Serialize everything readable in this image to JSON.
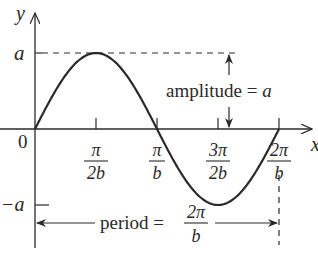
{
  "diagram": {
    "function": "y = a sin(bx)",
    "axes": {
      "x_label": "x",
      "y_label": "y",
      "origin_label": "0"
    },
    "y_ticks": [
      {
        "name": "a",
        "label": "a",
        "value": 1
      },
      {
        "name": "neg-a",
        "label": "−a",
        "value": -1
      }
    ],
    "x_ticks": [
      {
        "name": "pi-over-2b",
        "num": "π",
        "den": "2b",
        "value": 0.25
      },
      {
        "name": "pi-over-b",
        "num": "π",
        "den": "b",
        "value": 0.5
      },
      {
        "name": "3pi-over-2b",
        "num": "3π",
        "den": "2b",
        "value": 0.75
      },
      {
        "name": "2pi-over-b",
        "num": "2π",
        "den": "b",
        "value": 1.0
      }
    ],
    "amplitude": {
      "label": "amplitude = ",
      "var": "a"
    },
    "period": {
      "label": "period = ",
      "num": "2π",
      "den": "b"
    },
    "colors": {
      "ink": "#2a2a2a",
      "background": "#ffffff"
    }
  }
}
